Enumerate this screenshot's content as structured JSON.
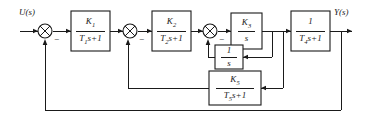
{
  "diagram": {
    "type": "block-diagram",
    "input_signal": "U(s)",
    "output_signal": "Y(s)",
    "blocks": [
      {
        "id": "g1",
        "numerator": "K",
        "numerator_sub": "1",
        "denominator": "T",
        "denominator_sub": "1",
        "denominator_tail": "s+1",
        "transfer_function": "K1/(T1s+1)"
      },
      {
        "id": "g2",
        "numerator": "K",
        "numerator_sub": "2",
        "denominator": "T",
        "denominator_sub": "2",
        "denominator_tail": "s+1",
        "transfer_function": "K2/(T2s+1)"
      },
      {
        "id": "g3",
        "numerator": "K",
        "numerator_sub": "3",
        "denominator": "s",
        "denominator_sub": "",
        "denominator_tail": "",
        "transfer_function": "K3/s"
      },
      {
        "id": "g4",
        "numerator": "1",
        "numerator_sub": "",
        "denominator": "T",
        "denominator_sub": "4",
        "denominator_tail": "s+1",
        "transfer_function": "1/(T4s+1)"
      },
      {
        "id": "h1",
        "numerator": "1",
        "numerator_sub": "",
        "denominator": "s",
        "denominator_sub": "",
        "denominator_tail": "",
        "transfer_function": "1/s"
      },
      {
        "id": "h2",
        "numerator": "K",
        "numerator_sub": "5",
        "denominator": "T",
        "denominator_sub": "5",
        "denominator_tail": "s+1",
        "transfer_function": "K5/(T5s+1)"
      }
    ],
    "summing_junctions": [
      {
        "id": "sum1",
        "sign_top": "+",
        "sign_bottom": "−"
      },
      {
        "id": "sum2",
        "sign_top": "+",
        "sign_bottom": "−"
      },
      {
        "id": "sum3",
        "sign_top": "+",
        "sign_bottom": "−"
      }
    ],
    "signs": {
      "minus": "−"
    },
    "colors": {
      "line": "#1a1a1a",
      "background": "#ffffff"
    }
  }
}
